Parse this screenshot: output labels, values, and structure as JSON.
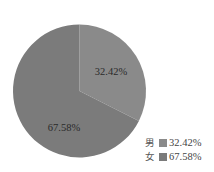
{
  "chart_data": {
    "type": "pie",
    "title": "",
    "categories": [
      "男",
      "女"
    ],
    "values": [
      32.42,
      67.58
    ],
    "unit": "%",
    "slices": [
      {
        "name": "男",
        "value": 32.42,
        "label": "32.42%",
        "color": "#8a8a8a"
      },
      {
        "name": "女",
        "value": 67.58,
        "label": "67.58%",
        "color": "#7b7b7b"
      }
    ],
    "start_angle_deg": 0,
    "direction": "clockwise",
    "legend": {
      "position": "bottom-right",
      "entries": [
        {
          "name": "男",
          "value_text": "32.42%",
          "color": "#8a8a8a"
        },
        {
          "name": "女",
          "value_text": "67.58%",
          "color": "#7b7b7b"
        }
      ]
    },
    "grid": false
  }
}
